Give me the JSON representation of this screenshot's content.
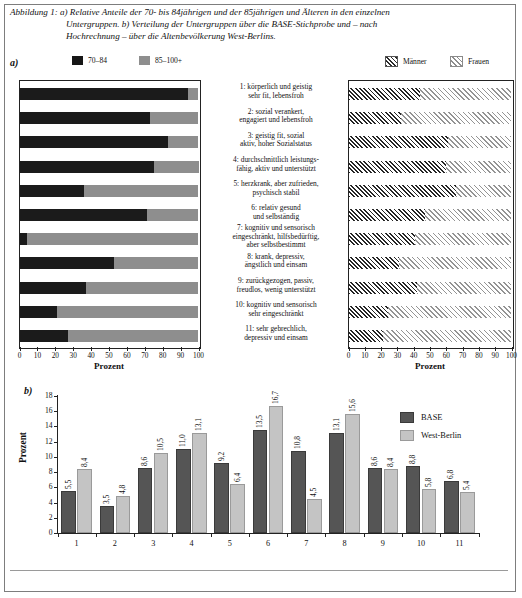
{
  "caption": {
    "line1": "Abbildung 1: a) Relative Anteile der 70- bis 84jährigen und der 85jährigen und Älteren in den einzelnen",
    "line2": "Untergruppen. b) Verteilung der Untergruppen über die BASE-Stichprobe und – nach",
    "line3": "Hochrechnung – über die Altenbevölkerung West-Berlins."
  },
  "panels": {
    "a_label": "a)",
    "b_label": "b)"
  },
  "legend_a_left": [
    {
      "label": "70–84",
      "color": "#161616",
      "swatch": "solid-black"
    },
    {
      "label": "85–100+",
      "color": "#8e8e8e",
      "swatch": "solid-gray"
    }
  ],
  "legend_a_right": [
    {
      "label": "Männer",
      "color": "#2b2b2b",
      "swatch": "hatch-dark"
    },
    {
      "label": "Frauen",
      "color": "#8d8d8d",
      "swatch": "hatch-light"
    }
  ],
  "legend_b": [
    {
      "label": "BASE",
      "color": "#555555"
    },
    {
      "label": "West-Berlin",
      "color": "#c4c4c4"
    }
  ],
  "subgroups": [
    {
      "num": "1",
      "l1": "1: körperlich und geistig",
      "l2": "sehr fit, lebensfroh",
      "l3": ""
    },
    {
      "num": "2",
      "l1": "2: sozial verankert,",
      "l2": "engagiert und lebensfroh",
      "l3": ""
    },
    {
      "num": "3",
      "l1": "3: geistig fit, sozial",
      "l2": "aktiv, hoher Sozialstatus",
      "l3": ""
    },
    {
      "num": "4",
      "l1": "4: durchschnittlich leistungs-",
      "l2": "fähig, aktiv und unterstützt",
      "l3": ""
    },
    {
      "num": "5",
      "l1": "5: herzkrank, aber zufrieden,",
      "l2": "psychisch stabil",
      "l3": ""
    },
    {
      "num": "6",
      "l1": "6: relativ gesund",
      "l2": "und selbständig",
      "l3": ""
    },
    {
      "num": "7",
      "l1": "7: kognitiv und sensorisch",
      "l2": "eingeschränkt, hilfsbedürftig,",
      "l3": "aber selbstbestimmt"
    },
    {
      "num": "8",
      "l1": "8: krank, depressiv,",
      "l2": "ängstlich und einsam",
      "l3": ""
    },
    {
      "num": "9",
      "l1": "9: zurückgezogen, passiv,",
      "l2": "freudlos, wenig unterstützt",
      "l3": ""
    },
    {
      "num": "10",
      "l1": "10: kognitiv und sensorisch",
      "l2": "sehr eingeschränkt",
      "l3": ""
    },
    {
      "num": "11",
      "l1": "11: sehr gebrechlich,",
      "l2": "depressiv und einsam",
      "l3": ""
    }
  ],
  "axis_labels": {
    "prozent_left": "Prozent",
    "prozent_right": "Prozent",
    "prozent_b": "Prozent"
  },
  "chart_data": [
    {
      "id": "a-left",
      "type": "bar",
      "orientation": "horizontal",
      "stacked": true,
      "title": "",
      "xlabel": "Prozent",
      "ylabel": "",
      "xlim": [
        0,
        100
      ],
      "xticks": [
        0,
        10,
        20,
        30,
        40,
        50,
        60,
        70,
        80,
        90,
        100
      ],
      "grid": false,
      "legend_position": "top-left",
      "categories": [
        "1",
        "2",
        "3",
        "4",
        "5",
        "6",
        "7",
        "8",
        "9",
        "10",
        "11"
      ],
      "series": [
        {
          "name": "70–84",
          "color": "#1b1b1b",
          "values": [
            94,
            73,
            83,
            75,
            36,
            71,
            4,
            53,
            37,
            21,
            27
          ]
        },
        {
          "name": "85–100+",
          "color": "#8e8e8e",
          "values": [
            6,
            27,
            17,
            25,
            64,
            29,
            96,
            47,
            63,
            79,
            73
          ]
        }
      ]
    },
    {
      "id": "a-right",
      "type": "bar",
      "orientation": "horizontal",
      "stacked": true,
      "title": "",
      "xlabel": "Prozent",
      "ylabel": "",
      "xlim": [
        0,
        100
      ],
      "xticks": [
        0,
        10,
        20,
        30,
        40,
        50,
        60,
        70,
        80,
        90,
        100
      ],
      "grid": false,
      "legend_position": "top-right",
      "categories": [
        "1",
        "2",
        "3",
        "4",
        "5",
        "6",
        "7",
        "8",
        "9",
        "10",
        "11"
      ],
      "series": [
        {
          "name": "Männer",
          "color": "#2b2b2b",
          "values": [
            44,
            32,
            61,
            60,
            66,
            47,
            41,
            31,
            42,
            24,
            21
          ]
        },
        {
          "name": "Frauen",
          "color": "#8d8d8d",
          "values": [
            56,
            68,
            39,
            40,
            34,
            53,
            59,
            69,
            58,
            76,
            79
          ]
        }
      ]
    },
    {
      "id": "b",
      "type": "bar",
      "orientation": "vertical",
      "stacked": false,
      "title": "",
      "xlabel": "",
      "ylabel": "Prozent",
      "ylim": [
        0,
        18
      ],
      "yticks": [
        0,
        2,
        4,
        6,
        8,
        10,
        12,
        14,
        16,
        18
      ],
      "grid": false,
      "legend_position": "top-right",
      "categories": [
        "1",
        "2",
        "3",
        "4",
        "5",
        "6",
        "7",
        "8",
        "9",
        "10",
        "11"
      ],
      "series": [
        {
          "name": "BASE",
          "color": "#555555",
          "values": [
            5.5,
            3.5,
            8.6,
            11.0,
            9.2,
            13.5,
            10.8,
            13.1,
            8.6,
            8.8,
            6.8
          ],
          "labels": [
            "5,5",
            "3,5",
            "8,6",
            "11,0",
            "9,2",
            "13,5",
            "10,8",
            "13,1",
            "8,6",
            "8,8",
            "6,8"
          ]
        },
        {
          "name": "West-Berlin",
          "color": "#c4c4c4",
          "values": [
            8.4,
            4.8,
            10.5,
            13.1,
            6.4,
            16.7,
            4.5,
            15.6,
            8.4,
            5.8,
            5.4
          ],
          "labels": [
            "8,4",
            "4,8",
            "10,5",
            "13,1",
            "6,4",
            "16,7",
            "4,5",
            "15,6",
            "8,4",
            "5,8",
            "5,4"
          ]
        }
      ]
    }
  ]
}
